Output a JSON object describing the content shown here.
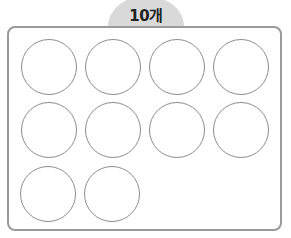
{
  "header": {
    "label": "10개",
    "tab_color": "#d9d9d9"
  },
  "frame": {
    "border_color": "#9a9a9a"
  },
  "circles": {
    "count": 10,
    "rows": [
      4,
      4,
      2
    ],
    "stroke_color": "#8c8c8c"
  }
}
